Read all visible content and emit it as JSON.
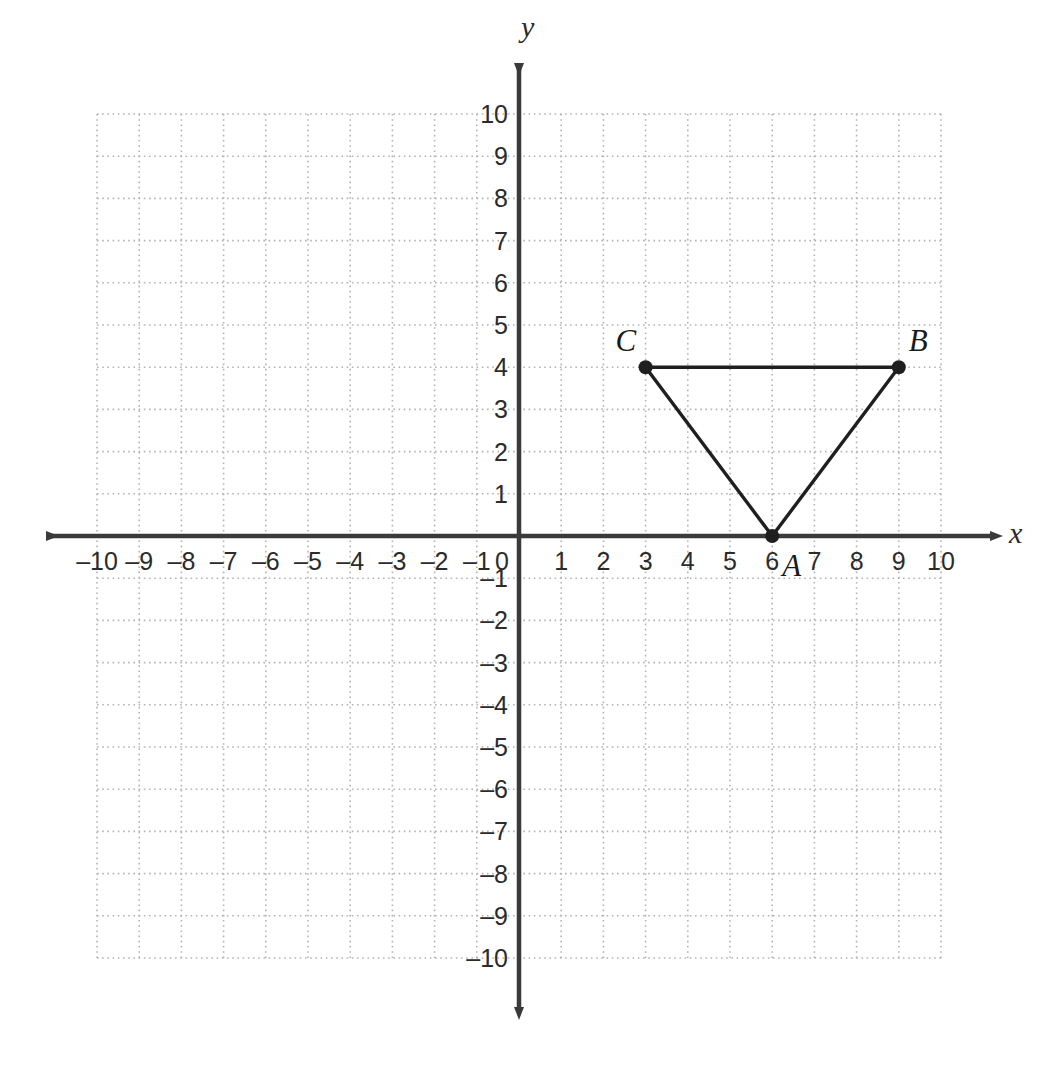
{
  "figure": {
    "kind": "coordinate-plane-with-triangle",
    "background_color": "#ffffff",
    "axis_color": "#3a3a3a",
    "grid_color": "#b3b3b3",
    "shape_color": "#1f1f1f"
  },
  "axes": {
    "x_name": "x",
    "y_name": "y",
    "origin_label": "0",
    "x_tick_labels": [
      "–10",
      "–9",
      "–8",
      "–7",
      "–6",
      "–5",
      "–4",
      "–3",
      "–2",
      "–1",
      "1",
      "2",
      "3",
      "4",
      "5",
      "6",
      "7",
      "8",
      "9",
      "10"
    ],
    "x_tick_values": [
      -10,
      -9,
      -8,
      -7,
      -6,
      -5,
      -4,
      -3,
      -2,
      -1,
      1,
      2,
      3,
      4,
      5,
      6,
      7,
      8,
      9,
      10
    ],
    "y_tick_labels": [
      "10",
      "9",
      "8",
      "7",
      "6",
      "5",
      "4",
      "3",
      "2",
      "1",
      "–1",
      "–2",
      "–3",
      "–4",
      "–5",
      "–6",
      "–7",
      "–8",
      "–9",
      "–10"
    ],
    "y_tick_values": [
      10,
      9,
      8,
      7,
      6,
      5,
      4,
      3,
      2,
      1,
      -1,
      -2,
      -3,
      -4,
      -5,
      -6,
      -7,
      -8,
      -9,
      -10
    ]
  },
  "chart_data": {
    "type": "scatter",
    "title": "",
    "xlabel": "x",
    "ylabel": "y",
    "xlim": [
      -10,
      10
    ],
    "ylim": [
      -10,
      10
    ],
    "grid": true,
    "legend": "none",
    "points": [
      {
        "label": "A",
        "x": 6,
        "y": 0,
        "label_position": "right"
      },
      {
        "label": "B",
        "x": 9,
        "y": 4,
        "label_position": "above-right"
      },
      {
        "label": "C",
        "x": 3,
        "y": 4,
        "label_position": "above-left"
      }
    ],
    "edges": [
      {
        "from": "A",
        "to": "B"
      },
      {
        "from": "B",
        "to": "C"
      },
      {
        "from": "C",
        "to": "A"
      }
    ],
    "annotations": [
      "A",
      "B",
      "C"
    ]
  }
}
